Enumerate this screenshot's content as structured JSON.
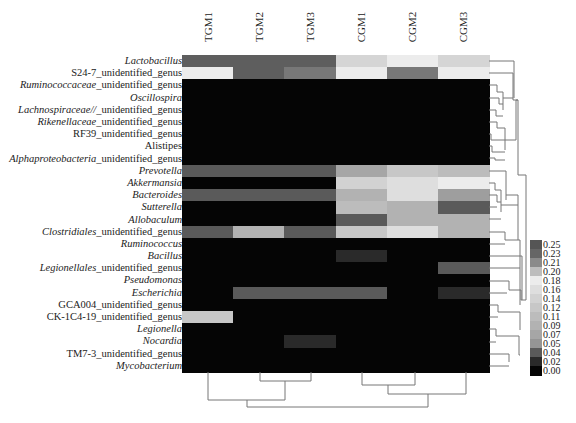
{
  "chart_data": {
    "type": "heatmap",
    "title": "",
    "columns": [
      "TGM1",
      "TGM2",
      "TGM3",
      "CGM1",
      "CGM2",
      "CGM3"
    ],
    "rows": [
      {
        "italic": "Lactobacillus",
        "suffix": ""
      },
      {
        "italic": "",
        "suffix": "S24-7_unidentified_genus"
      },
      {
        "italic": "Ruminococcaceae",
        "suffix": "_unidentified_genus"
      },
      {
        "italic": "Oscillospira",
        "suffix": ""
      },
      {
        "italic": "Lachnospiraceae//",
        "suffix": "_unidentified_genus"
      },
      {
        "italic": "Rikenellaceae",
        "suffix": "_unidentified_genus"
      },
      {
        "italic": "",
        "suffix": "RF39_unidentified_genus"
      },
      {
        "italic": "",
        "suffix": "Alistipes"
      },
      {
        "italic": "Alphaproteobacteria",
        "suffix": "_unidentified_genus"
      },
      {
        "italic": "Prevotella",
        "suffix": ""
      },
      {
        "italic": "Akkermansia",
        "suffix": ""
      },
      {
        "italic": "Bacteroides",
        "suffix": ""
      },
      {
        "italic": "Sutterella",
        "suffix": ""
      },
      {
        "italic": "Allobaculum",
        "suffix": ""
      },
      {
        "italic": "Clostridiales",
        "suffix": "_unidentified_genus"
      },
      {
        "italic": "Ruminococcus",
        "suffix": ""
      },
      {
        "italic": "Bacillus",
        "suffix": ""
      },
      {
        "italic": "Legionellales",
        "suffix": "_unidentified_genus"
      },
      {
        "italic": "Pseudomonas",
        "suffix": ""
      },
      {
        "italic": "Escherichia",
        "suffix": ""
      },
      {
        "italic": "",
        "suffix": "GCA004_unidentified_genus"
      },
      {
        "italic": "",
        "suffix": "CK-1C4-19_unidentified_genus"
      },
      {
        "italic": "Legionella",
        "suffix": ""
      },
      {
        "italic": "Nocardia",
        "suffix": ""
      },
      {
        "italic": "",
        "suffix": "TM7-3_unidentified_genus"
      },
      {
        "italic": "Mycobacterium",
        "suffix": ""
      }
    ],
    "values": [
      [
        0.24,
        0.24,
        0.24,
        0.19,
        0.18,
        0.19
      ],
      [
        0.18,
        0.24,
        0.22,
        0.18,
        0.22,
        0.18
      ],
      [
        0.0,
        0.0,
        0.0,
        0.0,
        0.0,
        0.0
      ],
      [
        0.0,
        0.0,
        0.0,
        0.0,
        0.0,
        0.0
      ],
      [
        0.0,
        0.0,
        0.0,
        0.0,
        0.0,
        0.0
      ],
      [
        0.0,
        0.0,
        0.0,
        0.0,
        0.0,
        0.0
      ],
      [
        0.0,
        0.0,
        0.0,
        0.0,
        0.0,
        0.0
      ],
      [
        0.0,
        0.0,
        0.0,
        0.0,
        0.0,
        0.0
      ],
      [
        0.0,
        0.0,
        0.0,
        0.0,
        0.0,
        0.0
      ],
      [
        0.04,
        0.04,
        0.04,
        0.07,
        0.12,
        0.11
      ],
      [
        0.0,
        0.0,
        0.0,
        0.14,
        0.16,
        0.18
      ],
      [
        0.04,
        0.04,
        0.04,
        0.09,
        0.16,
        0.06
      ],
      [
        0.0,
        0.0,
        0.0,
        0.11,
        0.09,
        0.04
      ],
      [
        0.0,
        0.0,
        0.0,
        0.04,
        0.09,
        0.09
      ],
      [
        0.04,
        0.09,
        0.04,
        0.12,
        0.16,
        0.09
      ],
      [
        0.0,
        0.0,
        0.0,
        0.0,
        0.0,
        0.0
      ],
      [
        0.0,
        0.0,
        0.0,
        0.02,
        0.0,
        0.0
      ],
      [
        0.0,
        0.0,
        0.0,
        0.0,
        0.0,
        0.04
      ],
      [
        0.0,
        0.0,
        0.0,
        0.0,
        0.0,
        0.0
      ],
      [
        0.0,
        0.04,
        0.04,
        0.04,
        0.0,
        0.02
      ],
      [
        0.0,
        0.0,
        0.0,
        0.0,
        0.0,
        0.0
      ],
      [
        0.12,
        0.0,
        0.0,
        0.0,
        0.0,
        0.0
      ],
      [
        0.0,
        0.0,
        0.0,
        0.0,
        0.0,
        0.0
      ],
      [
        0.0,
        0.0,
        0.02,
        0.0,
        0.0,
        0.0
      ],
      [
        0.0,
        0.0,
        0.0,
        0.0,
        0.0,
        0.0
      ],
      [
        0.0,
        0.0,
        0.0,
        0.0,
        0.0,
        0.0
      ]
    ],
    "colorbar": {
      "ticks": [
        "0.25",
        "0.23",
        "0.21",
        "0.20",
        "0.18",
        "0.16",
        "0.14",
        "0.12",
        "0.11",
        "0.09",
        "0.07",
        "0.05",
        "0.04",
        "0.02",
        "0.00"
      ],
      "colors": [
        "#555555",
        "#666666",
        "#8a8a8a",
        "#bdbdbd",
        "#ececec",
        "#dedede",
        "#d2d2d2",
        "#c7c7c7",
        "#bcbcbc",
        "#b2b2b2",
        "#a6a6a6",
        "#959595",
        "#5a5a5a",
        "#2a2a2a",
        "#050505"
      ]
    },
    "legend_position": "right",
    "row_dendrogram": "right",
    "col_dendrogram": "bottom",
    "grid": false
  }
}
